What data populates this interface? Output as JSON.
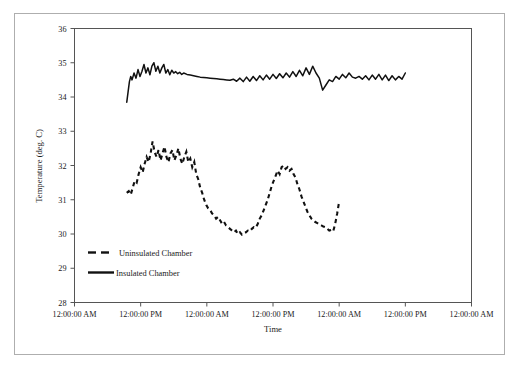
{
  "chart_data": {
    "type": "line",
    "title": "",
    "xlabel": "Time",
    "ylabel": "Temperature (deg. C)",
    "ylim": [
      28,
      36
    ],
    "y_ticks": [
      28,
      29,
      30,
      31,
      32,
      33,
      34,
      35,
      36
    ],
    "x_ticks": [
      0,
      1,
      2,
      3,
      4,
      5,
      6
    ],
    "x_tick_labels": [
      "12:00:00 AM",
      "12:00:00 PM",
      "12:00:00 AM",
      "12:00:00 PM",
      "12:00:00 AM",
      "12:00:00 PM",
      "12:00:00 AM"
    ],
    "xlim": [
      0,
      6
    ],
    "grid": false,
    "legend_position": "inside-lower-left",
    "series": [
      {
        "name": "Uninsulated Chamber",
        "style": "dashed",
        "color": "#111111",
        "x": [
          0.79,
          0.82,
          0.85,
          0.88,
          0.91,
          0.94,
          0.97,
          1.0,
          1.03,
          1.06,
          1.09,
          1.12,
          1.15,
          1.18,
          1.21,
          1.24,
          1.27,
          1.3,
          1.33,
          1.36,
          1.39,
          1.42,
          1.45,
          1.48,
          1.51,
          1.54,
          1.57,
          1.6,
          1.63,
          1.66,
          1.69,
          1.72,
          1.75,
          1.78,
          1.81,
          1.84,
          1.87,
          1.9,
          1.93,
          1.96,
          1.99,
          2.02,
          2.05,
          2.08,
          2.11,
          2.14,
          2.17,
          2.2,
          2.23,
          2.26,
          2.29,
          2.32,
          2.35,
          2.38,
          2.41,
          2.44,
          2.47,
          2.5,
          2.53,
          2.56,
          2.59,
          2.62,
          2.65,
          2.68,
          2.71,
          2.74,
          2.77,
          2.8,
          2.83,
          2.86,
          2.89,
          2.92,
          2.95,
          2.98,
          3.01,
          3.04,
          3.07,
          3.1,
          3.13,
          3.16,
          3.19,
          3.22,
          3.25,
          3.28,
          3.31,
          3.34,
          3.37,
          3.4,
          3.43,
          3.46,
          3.49,
          3.52,
          3.55,
          3.58,
          3.61,
          3.64,
          3.67,
          3.7,
          3.73,
          3.76,
          3.79,
          3.82,
          3.85,
          3.88,
          3.91,
          3.94,
          3.97,
          4.0
        ],
        "y": [
          31.2,
          31.25,
          31.15,
          31.35,
          31.55,
          31.5,
          31.75,
          31.95,
          31.8,
          32.05,
          32.25,
          32.1,
          32.35,
          32.7,
          32.4,
          32.25,
          32.45,
          32.15,
          32.35,
          32.55,
          32.25,
          32.1,
          32.35,
          32.45,
          32.15,
          32.3,
          32.5,
          32.2,
          32.05,
          32.25,
          32.4,
          32.1,
          32.2,
          31.95,
          32.1,
          31.75,
          31.6,
          31.35,
          31.2,
          31.0,
          30.85,
          30.75,
          30.7,
          30.6,
          30.55,
          30.45,
          30.5,
          30.4,
          30.3,
          30.35,
          30.25,
          30.2,
          30.15,
          30.1,
          30.05,
          30.1,
          30.0,
          30.05,
          29.98,
          30.02,
          30.05,
          30.1,
          30.08,
          30.15,
          30.2,
          30.18,
          30.3,
          30.45,
          30.55,
          30.7,
          30.85,
          31.0,
          31.2,
          31.4,
          31.55,
          31.7,
          31.85,
          31.75,
          31.95,
          32.0,
          31.9,
          31.95,
          31.85,
          31.9,
          31.75,
          31.65,
          31.45,
          31.3,
          31.1,
          30.95,
          30.8,
          30.65,
          30.55,
          30.45,
          30.4,
          30.35,
          30.32,
          30.28,
          30.25,
          30.22,
          30.2,
          30.15,
          30.1,
          30.12,
          30.08,
          30.3,
          30.6,
          30.95
        ]
      },
      {
        "name": "Insulated Chamber",
        "style": "solid",
        "color": "#111111",
        "x": [
          0.79,
          0.81,
          0.83,
          0.85,
          0.87,
          0.9,
          0.93,
          0.96,
          0.99,
          1.02,
          1.05,
          1.08,
          1.11,
          1.14,
          1.17,
          1.2,
          1.23,
          1.26,
          1.29,
          1.32,
          1.35,
          1.38,
          1.41,
          1.44,
          1.47,
          1.5,
          1.53,
          1.56,
          1.59,
          1.62,
          1.65,
          1.7,
          1.75,
          1.8,
          1.85,
          1.9,
          1.95,
          2.0,
          2.05,
          2.1,
          2.15,
          2.2,
          2.25,
          2.3,
          2.35,
          2.4,
          2.45,
          2.5,
          2.55,
          2.6,
          2.65,
          2.7,
          2.75,
          2.8,
          2.85,
          2.9,
          2.95,
          3.0,
          3.05,
          3.1,
          3.15,
          3.2,
          3.25,
          3.3,
          3.35,
          3.4,
          3.45,
          3.5,
          3.55,
          3.6,
          3.65,
          3.7,
          3.75,
          3.8,
          3.85,
          3.9,
          3.95,
          4.0,
          4.05,
          4.1,
          4.15,
          4.2,
          4.25,
          4.3,
          4.35,
          4.4,
          4.45,
          4.5,
          4.55,
          4.6,
          4.65,
          4.7,
          4.75,
          4.8,
          4.85,
          4.9,
          4.95,
          5.0
        ],
        "y": [
          33.85,
          34.15,
          34.45,
          34.6,
          34.5,
          34.7,
          34.55,
          34.8,
          34.6,
          34.75,
          34.95,
          34.7,
          34.85,
          34.65,
          34.9,
          35.0,
          34.75,
          34.9,
          34.7,
          34.85,
          34.95,
          34.7,
          34.8,
          34.65,
          34.78,
          34.7,
          34.74,
          34.68,
          34.72,
          34.66,
          34.7,
          34.66,
          34.64,
          34.62,
          34.6,
          34.58,
          34.57,
          34.56,
          34.55,
          34.54,
          34.53,
          34.52,
          34.51,
          34.5,
          34.49,
          34.52,
          34.46,
          34.55,
          34.45,
          34.58,
          34.46,
          34.6,
          34.48,
          34.62,
          34.5,
          34.64,
          34.52,
          34.66,
          34.54,
          34.68,
          34.56,
          34.7,
          34.58,
          34.74,
          34.6,
          34.78,
          34.62,
          34.85,
          34.66,
          34.9,
          34.7,
          34.55,
          34.2,
          34.35,
          34.5,
          34.45,
          34.6,
          34.52,
          34.66,
          34.56,
          34.7,
          34.58,
          34.55,
          34.6,
          34.52,
          34.62,
          34.5,
          34.64,
          34.52,
          34.66,
          34.5,
          34.64,
          34.48,
          34.62,
          34.5,
          34.6,
          34.52,
          34.7
        ]
      }
    ]
  },
  "axes": {
    "y_title": "Temperature (deg. C)",
    "x_title": "Time",
    "y_tick_labels": [
      "36",
      "35",
      "34",
      "33",
      "32",
      "31",
      "30",
      "29",
      "28"
    ],
    "x_tick_labels": [
      "12:00:00 AM",
      "12:00:00 PM",
      "12:00:00 AM",
      "12:00:00 PM",
      "12:00:00 AM",
      "12:00:00 PM",
      "12:00:00 AM"
    ]
  },
  "legend": {
    "entries": [
      {
        "label": "Uninsulated Chamber",
        "style": "dashed"
      },
      {
        "label": "Insulated Chamber",
        "style": "solid"
      }
    ]
  },
  "colors": {
    "series": "#111111",
    "axis": "#555555",
    "frame": "#aeaeae",
    "text": "#1a1a1a",
    "background": "#ffffff"
  }
}
